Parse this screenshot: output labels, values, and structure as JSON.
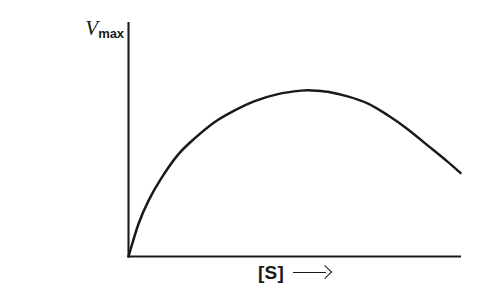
{
  "figure": {
    "background_color": "#ffffff",
    "line_color": "#1a1a1a",
    "axis_color": "#1a1a1a"
  },
  "axes": {
    "y_top_label": {
      "symbol": "V",
      "subscript": "max"
    },
    "y_title_line1": "Reaction velocity",
    "y_title_symbol": "V",
    "y_title_subscript": "0",
    "y_arrow": "right-arrow-icon",
    "x_title": "[S]",
    "x_arrow": "right-arrow-icon"
  },
  "chart_data": {
    "type": "line",
    "title": "",
    "subtitle": "",
    "xlabel": "[S]",
    "ylabel": "Reaction velocity V0",
    "xlim": [
      0,
      1
    ],
    "ylim": [
      0,
      1
    ],
    "grid": false,
    "legend": "none",
    "annotations": [
      {
        "text": "Vmax",
        "position": "y-axis-top",
        "note": "maximum velocity marker at top of y axis"
      },
      {
        "text": "[S]",
        "position": "x-axis-center",
        "note": "substrate concentration, increasing to the right"
      }
    ],
    "series": [
      {
        "name": "substrate inhibition curve",
        "note": "velocity rises from origin, peaks below Vmax, then declines at high [S]",
        "x": [
          0.0,
          0.03,
          0.06,
          0.1,
          0.15,
          0.2,
          0.26,
          0.32,
          0.38,
          0.45,
          0.52,
          0.55,
          0.6,
          0.66,
          0.72,
          0.78,
          0.84,
          0.9,
          0.96,
          1.0
        ],
        "y": [
          0.0,
          0.14,
          0.24,
          0.34,
          0.44,
          0.51,
          0.58,
          0.63,
          0.67,
          0.7,
          0.715,
          0.716,
          0.71,
          0.69,
          0.66,
          0.61,
          0.55,
          0.48,
          0.41,
          0.36
        ]
      }
    ]
  }
}
